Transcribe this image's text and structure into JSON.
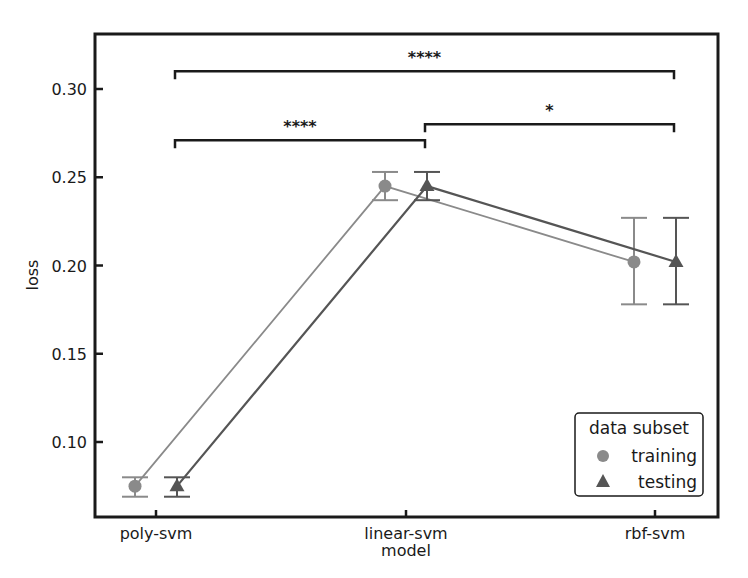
{
  "chart_data": {
    "type": "line",
    "title": "",
    "xlabel": "model",
    "ylabel": "loss",
    "categories": [
      "poly-svm",
      "linear-svm",
      "rbf-svm"
    ],
    "ylim": [
      0.059,
      0.328
    ],
    "yticks": [
      0.1,
      0.15,
      0.2,
      0.25,
      0.3
    ],
    "ytick_labels": [
      "0.10",
      "0.15",
      "0.20",
      "0.25",
      "0.30"
    ],
    "grid": false,
    "legend": {
      "title": "data subset",
      "position": "lower right",
      "entries": [
        "training",
        "testing"
      ]
    },
    "series": [
      {
        "name": "training",
        "marker": "circle",
        "color": "#8a8a8a",
        "values": [
          0.075,
          0.245,
          0.202
        ],
        "error_low": [
          0.069,
          0.237,
          0.178
        ],
        "error_high": [
          0.08,
          0.253,
          0.227
        ]
      },
      {
        "name": "testing",
        "marker": "triangle",
        "color": "#555555",
        "values": [
          0.075,
          0.245,
          0.202
        ],
        "error_low": [
          0.069,
          0.237,
          0.178
        ],
        "error_high": [
          0.08,
          0.253,
          0.227
        ]
      }
    ],
    "annotations": [
      {
        "from": "poly-svm",
        "to": "rbf-svm",
        "label": "****",
        "y": 0.31
      },
      {
        "from": "linear-svm",
        "to": "rbf-svm",
        "label": "*",
        "y": 0.28
      },
      {
        "from": "poly-svm",
        "to": "linear-svm",
        "label": "****",
        "y": 0.271
      }
    ]
  }
}
